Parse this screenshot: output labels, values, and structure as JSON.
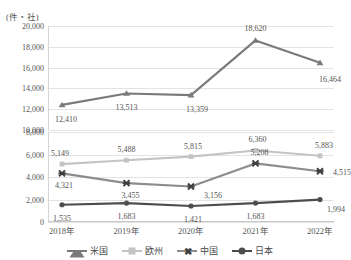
{
  "cut_top_text": "",
  "unit_label": "(件・社)",
  "legend": {
    "items": [
      {
        "name": "us",
        "label": "米国",
        "color": "#7a7a7a",
        "marker": "triangle"
      },
      {
        "name": "europe",
        "label": "欧州",
        "color": "#c4c4c4",
        "marker": "square"
      },
      {
        "name": "china",
        "label": "中国",
        "color": "#8c8c8c",
        "marker": "x"
      },
      {
        "name": "japan",
        "label": "日本",
        "color": "#4d4d4d",
        "marker": "circle"
      }
    ]
  },
  "axes": {
    "x_ticks": [
      "2018年",
      "2019年",
      "2020年",
      "2021年",
      "2022年"
    ],
    "top_y_ticks": [
      "10,000",
      "12,000",
      "14,000",
      "16,000",
      "18,000",
      "20,000"
    ],
    "bottom_y_ticks": [
      "0",
      "2,000",
      "4,000",
      "6,000",
      "8,000"
    ]
  },
  "labels": {
    "us": [
      "12,410",
      "13,513",
      "13,359",
      "18,620",
      "16,464"
    ],
    "europe": [
      "5,149",
      "5,488",
      "5,815",
      "6,360",
      "5,883"
    ],
    "china": [
      "4,321",
      "3,455",
      "3,156",
      "5,208",
      "4,515"
    ],
    "japan": [
      "1,535",
      "1,683",
      "1,421",
      "1,683",
      "1,994"
    ]
  },
  "chart_data": {
    "type": "line",
    "title": "",
    "xlabel": "",
    "ylabel": "(件・社)",
    "grid": true,
    "legend_position": "bottom",
    "broken_axis": true,
    "categories": [
      "2018年",
      "2019年",
      "2020年",
      "2021年",
      "2022年"
    ],
    "panels": [
      {
        "name": "top",
        "ylim": [
          10000,
          20000
        ],
        "yticks": [
          10000,
          12000,
          14000,
          16000,
          18000,
          20000
        ],
        "series": [
          "米国"
        ]
      },
      {
        "name": "bottom",
        "ylim": [
          0,
          8000
        ],
        "yticks": [
          0,
          2000,
          4000,
          6000,
          8000
        ],
        "series": [
          "欧州",
          "中国",
          "日本"
        ]
      }
    ],
    "series": [
      {
        "name": "米国",
        "panel": "top",
        "color": "#7a7a7a",
        "marker": "triangle",
        "values": [
          12410,
          13513,
          13359,
          18620,
          16464
        ]
      },
      {
        "name": "欧州",
        "panel": "bottom",
        "color": "#c4c4c4",
        "marker": "square",
        "values": [
          5149,
          5488,
          5815,
          6360,
          5883
        ]
      },
      {
        "name": "中国",
        "panel": "bottom",
        "color": "#8c8c8c",
        "marker": "x",
        "values": [
          4321,
          3455,
          3156,
          5208,
          4515
        ]
      },
      {
        "name": "日本",
        "panel": "bottom",
        "color": "#4d4d4d",
        "marker": "circle",
        "values": [
          1535,
          1683,
          1421,
          1683,
          1994
        ]
      }
    ]
  }
}
